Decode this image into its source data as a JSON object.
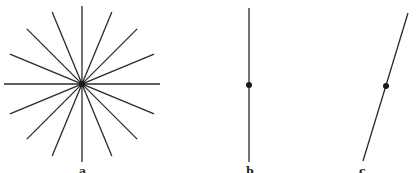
{
  "panels": [
    {
      "label": "a",
      "type": "star-of-lines",
      "line_count": 8,
      "center": [
        82,
        84
      ],
      "radius": 78
    },
    {
      "label": "b",
      "type": "vertical-line-with-point",
      "line": [
        [
          249,
          8
        ],
        [
          249,
          162
        ]
      ],
      "point": [
        249,
        85
      ]
    },
    {
      "label": "c",
      "type": "slanted-line-with-point",
      "line": [
        [
          408,
          13
        ],
        [
          363,
          161
        ]
      ],
      "point": [
        386,
        86
      ]
    }
  ],
  "colors": {
    "line": "#2a2a2a",
    "background": "#ffffff"
  }
}
